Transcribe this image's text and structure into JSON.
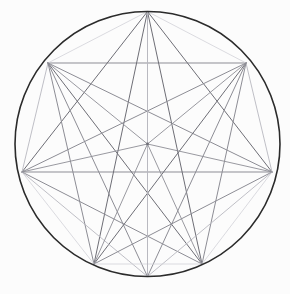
{
  "figure": {
    "type": "geometric-line-diagram",
    "canvas": {
      "width": 290,
      "height": 294,
      "background": "#fcfcfc"
    },
    "circle": {
      "cx": 147.5,
      "cy": 144.0,
      "r": 132.5,
      "stroke": "#2b2b2b",
      "stroke_width": 1.6
    },
    "center_point": {
      "x": 147.5,
      "y": 144.0,
      "label": "center"
    },
    "palette": {
      "outline": "#2b2b2b",
      "dark_chord": "#6e6e76",
      "mid_chord": "#8d8d95",
      "light_chord": "#b8b8c0",
      "faint_chord": "#d2d2d8",
      "background": "#fcfcfc"
    },
    "vertices": [
      {
        "id": "T",
        "name": "top",
        "x": 147.5,
        "y": 11.5,
        "angle_deg": 90
      },
      {
        "id": "UL",
        "name": "upper-left",
        "x": 48.0,
        "y": 63.0,
        "angle_deg": 141
      },
      {
        "id": "UR",
        "name": "upper-right",
        "x": 246.0,
        "y": 63.0,
        "angle_deg": 39
      },
      {
        "id": "L",
        "name": "left",
        "x": 22.0,
        "y": 172.0,
        "angle_deg": 192
      },
      {
        "id": "R",
        "name": "right",
        "x": 272.0,
        "y": 172.0,
        "angle_deg": 348
      },
      {
        "id": "BL",
        "name": "bottom-left",
        "x": 94.0,
        "y": 264.0,
        "angle_deg": 245
      },
      {
        "id": "BR",
        "name": "bottom-right",
        "x": 202.0,
        "y": 264.0,
        "angle_deg": 295
      },
      {
        "id": "B",
        "name": "bottom",
        "x": 147.5,
        "y": 276.5,
        "angle_deg": 270
      }
    ],
    "chords": [
      {
        "from": "UL",
        "to": "UR",
        "tone": "mid_chord",
        "w": 1.0,
        "note": "upper horizontal chord"
      },
      {
        "from": "L",
        "to": "R",
        "tone": "mid_chord",
        "w": 1.0,
        "note": "horizontal diameter-like chord"
      },
      {
        "from": "T",
        "to": "B",
        "tone": "light_chord",
        "w": 0.9,
        "note": "vertical axis"
      },
      {
        "from": "T",
        "to": "UL",
        "tone": "faint_chord",
        "w": 0.8
      },
      {
        "from": "T",
        "to": "UR",
        "tone": "faint_chord",
        "w": 0.8
      },
      {
        "from": "T",
        "to": "L",
        "tone": "dark_chord",
        "w": 1.0
      },
      {
        "from": "T",
        "to": "R",
        "tone": "dark_chord",
        "w": 1.0
      },
      {
        "from": "T",
        "to": "BL",
        "tone": "dark_chord",
        "w": 1.0
      },
      {
        "from": "T",
        "to": "BR",
        "tone": "dark_chord",
        "w": 1.0
      },
      {
        "from": "UL",
        "to": "L",
        "tone": "light_chord",
        "w": 0.9
      },
      {
        "from": "UL",
        "to": "R",
        "tone": "mid_chord",
        "w": 1.0
      },
      {
        "from": "UL",
        "to": "BL",
        "tone": "mid_chord",
        "w": 1.0
      },
      {
        "from": "UL",
        "to": "BR",
        "tone": "dark_chord",
        "w": 1.0
      },
      {
        "from": "UL",
        "to": "B",
        "tone": "mid_chord",
        "w": 1.0
      },
      {
        "from": "UR",
        "to": "R",
        "tone": "light_chord",
        "w": 0.9
      },
      {
        "from": "UR",
        "to": "L",
        "tone": "mid_chord",
        "w": 1.0
      },
      {
        "from": "UR",
        "to": "BR",
        "tone": "mid_chord",
        "w": 1.0
      },
      {
        "from": "UR",
        "to": "BL",
        "tone": "dark_chord",
        "w": 1.0
      },
      {
        "from": "UR",
        "to": "B",
        "tone": "mid_chord",
        "w": 1.0
      },
      {
        "from": "L",
        "to": "BL",
        "tone": "faint_chord",
        "w": 0.8
      },
      {
        "from": "L",
        "to": "BR",
        "tone": "mid_chord",
        "w": 1.0
      },
      {
        "from": "L",
        "to": "B",
        "tone": "light_chord",
        "w": 0.9
      },
      {
        "from": "R",
        "to": "BR",
        "tone": "faint_chord",
        "w": 0.8
      },
      {
        "from": "R",
        "to": "BL",
        "tone": "mid_chord",
        "w": 1.0
      },
      {
        "from": "R",
        "to": "B",
        "tone": "light_chord",
        "w": 0.9
      },
      {
        "from": "BL",
        "to": "BR",
        "tone": "faint_chord",
        "w": 0.8
      }
    ],
    "spokes": [
      {
        "to": "T",
        "tone": "light_chord",
        "w": 0.9
      },
      {
        "to": "UL",
        "tone": "mid_chord",
        "w": 0.9
      },
      {
        "to": "UR",
        "tone": "mid_chord",
        "w": 0.9
      },
      {
        "to": "L",
        "tone": "mid_chord",
        "w": 0.9
      },
      {
        "to": "R",
        "tone": "mid_chord",
        "w": 0.9
      },
      {
        "to": "BL",
        "tone": "mid_chord",
        "w": 0.9
      },
      {
        "to": "BR",
        "tone": "mid_chord",
        "w": 0.9
      },
      {
        "to": "B",
        "tone": "light_chord",
        "w": 0.9
      }
    ]
  }
}
